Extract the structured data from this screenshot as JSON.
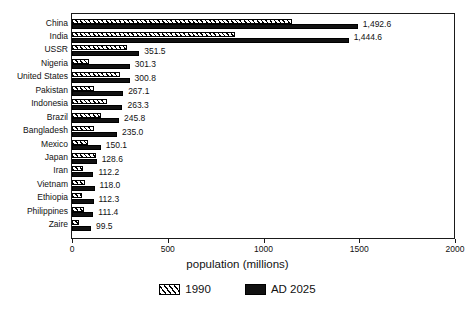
{
  "chart_data": {
    "type": "bar",
    "orientation": "horizontal",
    "title": "",
    "xlabel": "population (millions)",
    "ylabel": "",
    "xlim": [
      0,
      2000
    ],
    "xticks": [
      0,
      500,
      1000,
      1500,
      2000
    ],
    "xticklabels": [
      "0",
      "500",
      "1000",
      "1500",
      "2000"
    ],
    "grid": false,
    "legend_position": "below",
    "categories": [
      "China",
      "India",
      "USSR",
      "Nigeria",
      "United States",
      "Pakistan",
      "Indonesia",
      "Brazil",
      "Bangladesh",
      "Mexico",
      "Japan",
      "Iran",
      "Vietnam",
      "Ethiopia",
      "Philippines",
      "Zaire"
    ],
    "series": [
      {
        "name": "1990",
        "fill": "diagonal-hatch",
        "values": [
          1150,
          853,
          289,
          87,
          250,
          113,
          184,
          150,
          115,
          86,
          124,
          56,
          67,
          50,
          62,
          36
        ]
      },
      {
        "name": "AD 2025",
        "fill": "solid-black",
        "values": [
          1492.6,
          1444.6,
          351.5,
          301.3,
          300.8,
          267.1,
          263.3,
          245.8,
          235.0,
          150.1,
          128.6,
          112.2,
          118.0,
          112.3,
          111.4,
          99.5
        ]
      }
    ],
    "value_labels": [
      "1,492.6",
      "1,444.6",
      "351.5",
      "301.3",
      "300.8",
      "267.1",
      "263.3",
      "245.8",
      "235.0",
      "150.1",
      "128.6",
      "112.2",
      "118.0",
      "112.3",
      "111.4",
      "99.5"
    ]
  },
  "legend": {
    "entries": [
      {
        "label": "1990",
        "swatch": "hatch-swatch"
      },
      {
        "label": "AD 2025",
        "swatch": "solid-swatch"
      }
    ]
  },
  "axis": {
    "x_title": "population (millions)"
  }
}
